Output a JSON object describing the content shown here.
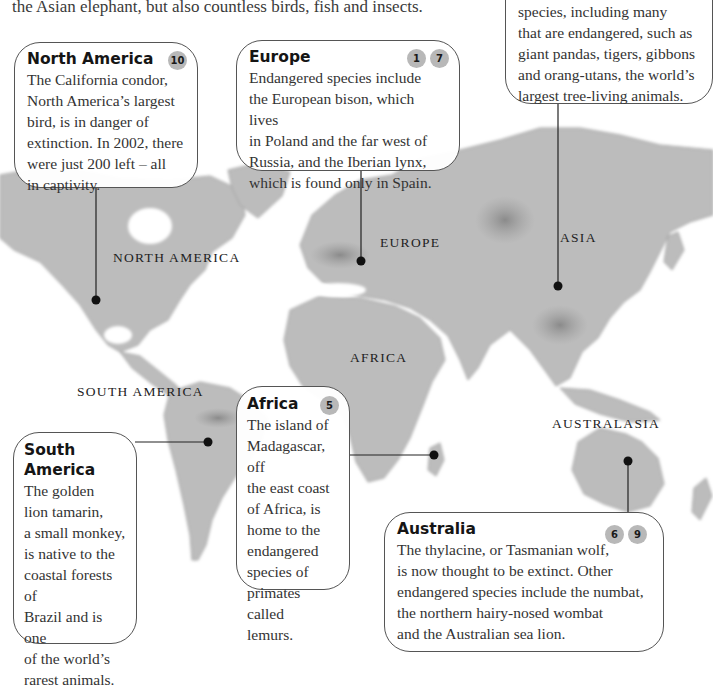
{
  "intro_text": "the Asian elephant, but also countless birds, fish and insects.",
  "map": {
    "labels": {
      "north_america": "NORTH AMERICA",
      "south_america": "SOUTH AMERICA",
      "europe": "EUROPE",
      "africa": "AFRICA",
      "asia": "ASIA",
      "australasia": "AUSTRALASIA"
    },
    "colors": {
      "land": "#b9b9b9",
      "land_dark": "#8f8f8f",
      "ocean": "#ffffff",
      "badge": "#b8b8b8",
      "leader_line": "#222222"
    }
  },
  "callouts": {
    "asia": {
      "title": "",
      "badges": [],
      "lines": [
        "species, including many",
        "that are endangered, such as",
        "giant pandas, tigers, gibbons",
        "and orang-utans, the world’s",
        "largest tree-living animals."
      ]
    },
    "north_america": {
      "title": "North America",
      "badges": [
        "10"
      ],
      "lines": [
        "The California condor,",
        "North America’s largest",
        "bird, is in danger of",
        "extinction. In 2002, there",
        "were just 200 left – all",
        "in captivity."
      ]
    },
    "europe": {
      "title": "Europe",
      "badges": [
        "1",
        "7"
      ],
      "lines": [
        "Endangered species include",
        "the European bison, which lives",
        "in Poland and the far west of",
        "Russia, and the Iberian lynx,",
        "which is found only in Spain."
      ]
    },
    "africa": {
      "title": "Africa",
      "badges": [
        "5"
      ],
      "lines": [
        "The island of",
        "Madagascar, off",
        "the east coast",
        "of Africa, is",
        "home to the",
        "endangered",
        "species of",
        "primates called",
        "lemurs."
      ]
    },
    "south_america": {
      "title_line1": "South",
      "title_line2": "America",
      "badges": [],
      "lines": [
        "The golden",
        "lion tamarin,",
        "a small monkey,",
        "is native to the",
        "coastal forests of",
        "Brazil and is one",
        "of the world’s",
        "rarest animals."
      ]
    },
    "australia": {
      "title": "Australia",
      "badges": [
        "6",
        "9"
      ],
      "lines": [
        "The thylacine, or Tasmanian wolf,",
        "is now thought to be extinct. Other",
        "endangered species include the numbat,",
        "the northern hairy-nosed wombat",
        "and the Australian sea lion."
      ]
    }
  }
}
